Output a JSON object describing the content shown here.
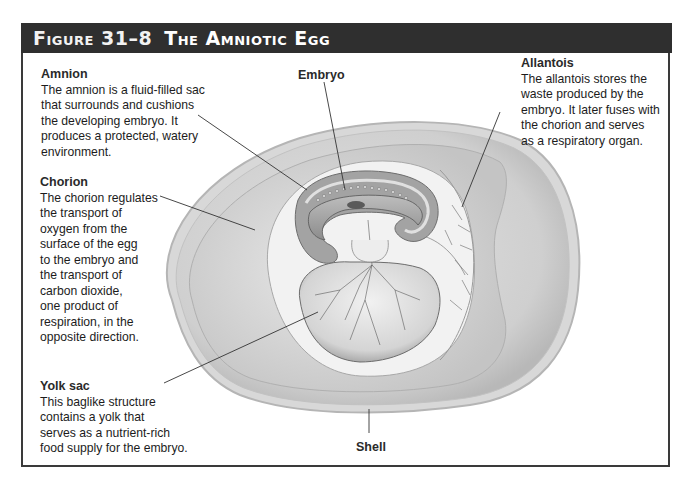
{
  "figure": {
    "number": "Figure 31–8",
    "title": "The Amniotic Egg"
  },
  "labels": {
    "amnion": {
      "heading": "Amnion",
      "lines": [
        "The amnion is a fluid-filled sac",
        "that surrounds and cushions",
        "the developing embryo. It",
        "produces a protected, watery",
        "environment."
      ]
    },
    "embryo": {
      "heading": "Embryo"
    },
    "allantois": {
      "heading": "Allantois",
      "lines": [
        "The allantois stores the",
        "waste produced by the",
        "embryo. It later fuses with",
        "the chorion and serves",
        "as a respiratory organ."
      ]
    },
    "chorion": {
      "heading": "Chorion",
      "lines": [
        "The chorion regulates",
        "the transport of",
        "oxygen from the",
        "surface of the egg",
        "to the embryo and",
        "the transport of",
        "carbon dioxide,",
        "one product of",
        "respiration, in the",
        "opposite direction."
      ]
    },
    "yolk_sac": {
      "heading": "Yolk sac",
      "lines": [
        "This baglike structure",
        "contains a yolk that",
        "serves as a nutrient-rich",
        "food supply for the embryo."
      ]
    },
    "shell": {
      "heading": "Shell"
    }
  },
  "colors": {
    "header_bg": "#2f2f2f",
    "frame_border": "#3a3a3a",
    "shell_outer": "#c9c9c9",
    "albumen": "#d6d6d6",
    "chorion_space": "#ececec",
    "amnion_wall": "#9a9a9a",
    "leader_line": "#333333"
  }
}
